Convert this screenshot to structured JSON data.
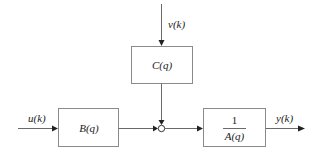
{
  "diagram": {
    "signals": {
      "input": "u(k)",
      "noise": "v(k)",
      "output": "y(k)"
    },
    "blocks": [
      {
        "id": "B",
        "label": "B(q)"
      },
      {
        "id": "C",
        "label": "C(q)"
      },
      {
        "id": "A",
        "numerator": "1",
        "denominator": "A(q)"
      }
    ],
    "junction": {
      "type": "summing"
    },
    "colors": {
      "line": "#6a6a6a",
      "box_border": "#8a8a8a",
      "text": "#222222",
      "background": "#ffffff"
    }
  }
}
